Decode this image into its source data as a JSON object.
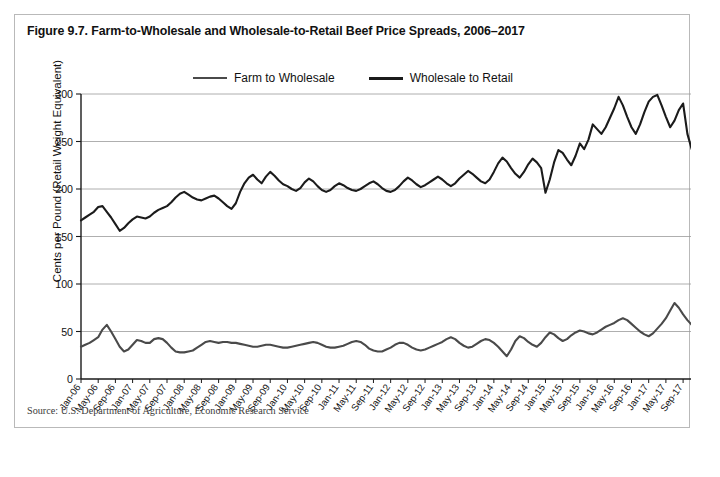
{
  "figure": {
    "title": "Figure 9.7. Farm-to-Wholesale and Wholesale-to-Retail Beef Price Spreads, 2006–2017",
    "source": "Source: U.S. Department of Agriculture, Economic Research Service"
  },
  "legend": {
    "items": [
      {
        "label": "Farm to Wholesale",
        "color": "#4a4a4a",
        "weight": "thin"
      },
      {
        "label": "Wholesale to Retail",
        "color": "#1b1b1b",
        "weight": "thick"
      }
    ]
  },
  "chart_data": {
    "type": "line",
    "title": "Figure 9.7. Farm-to-Wholesale and Wholesale-to-Retail Beef Price Spreads, 2006–2017",
    "xlabel": "",
    "ylabel": "Cents per Pound (Retail Weight Equivalent)",
    "ylim": [
      0,
      300
    ],
    "yticks": [
      0,
      50,
      100,
      150,
      200,
      250,
      300
    ],
    "grid": "horizontal",
    "legend_position": "top-center",
    "xtick_step_months": 4,
    "x_tick_labels": [
      "Jan-06",
      "May-06",
      "Sep-06",
      "Jan-07",
      "May-07",
      "Sep-07",
      "Jan-08",
      "May-08",
      "Sep-08",
      "Jan-09",
      "May-09",
      "Sep-09",
      "Jan-10",
      "May-10",
      "Sep-10",
      "Jan-11",
      "May-11",
      "Sep-11",
      "Jan-12",
      "May-12",
      "Sep-12",
      "Jan-13",
      "May-13",
      "Sep-13",
      "Jan-14",
      "May-14",
      "Sep-14",
      "Jan-15",
      "May-15",
      "Sep-15",
      "Jan-16",
      "May-16",
      "Sep-16",
      "Jan-17",
      "May-17",
      "Sep-17"
    ],
    "x_start": "Jan-06",
    "x_end": "Dec-17",
    "n_points": 144,
    "series": [
      {
        "name": "Farm to Wholesale",
        "color": "#4a4a4a",
        "values": [
          34,
          36,
          38,
          41,
          44,
          52,
          57,
          50,
          42,
          34,
          29,
          31,
          36,
          41,
          40,
          38,
          38,
          42,
          43,
          42,
          38,
          33,
          29,
          28,
          28,
          29,
          30,
          33,
          36,
          39,
          40,
          39,
          38,
          39,
          39,
          38,
          38,
          37,
          36,
          35,
          34,
          34,
          35,
          36,
          36,
          35,
          34,
          33,
          33,
          34,
          35,
          36,
          37,
          38,
          39,
          38,
          36,
          34,
          33,
          33,
          34,
          35,
          37,
          39,
          40,
          39,
          36,
          32,
          30,
          29,
          29,
          31,
          33,
          36,
          38,
          38,
          36,
          33,
          31,
          30,
          31,
          33,
          35,
          37,
          39,
          42,
          44,
          42,
          38,
          35,
          33,
          34,
          37,
          40,
          42,
          41,
          38,
          34,
          29,
          24,
          31,
          40,
          45,
          43,
          39,
          36,
          34,
          38,
          44,
          49,
          47,
          43,
          40,
          42,
          46,
          49,
          51,
          50,
          48,
          47,
          49,
          52,
          55,
          57,
          59,
          62,
          64,
          62,
          58,
          54,
          50,
          47,
          45,
          48,
          53,
          58,
          64,
          72,
          80,
          75,
          68,
          62,
          57,
          52
        ]
      },
      {
        "name": "Wholesale to Retail",
        "color": "#1b1b1b",
        "values": [
          167,
          170,
          173,
          176,
          181,
          182,
          176,
          170,
          163,
          156,
          159,
          164,
          168,
          171,
          170,
          169,
          171,
          175,
          178,
          180,
          182,
          186,
          191,
          195,
          197,
          194,
          191,
          189,
          188,
          190,
          192,
          193,
          190,
          186,
          182,
          179,
          185,
          197,
          206,
          212,
          215,
          210,
          206,
          213,
          218,
          214,
          209,
          205,
          203,
          200,
          198,
          201,
          207,
          211,
          208,
          203,
          199,
          197,
          199,
          203,
          206,
          204,
          201,
          199,
          198,
          200,
          203,
          206,
          208,
          205,
          201,
          198,
          197,
          199,
          203,
          208,
          212,
          209,
          205,
          202,
          204,
          207,
          210,
          213,
          210,
          206,
          203,
          206,
          211,
          215,
          219,
          216,
          212,
          208,
          206,
          210,
          218,
          227,
          233,
          229,
          222,
          216,
          212,
          218,
          226,
          232,
          228,
          222,
          196,
          210,
          228,
          241,
          238,
          231,
          225,
          235,
          248,
          242,
          252,
          268,
          263,
          258,
          265,
          275,
          285,
          297,
          288,
          276,
          265,
          258,
          268,
          281,
          292,
          297,
          299,
          288,
          276,
          265,
          272,
          283,
          290,
          258,
          242,
          259
        ]
      }
    ]
  }
}
